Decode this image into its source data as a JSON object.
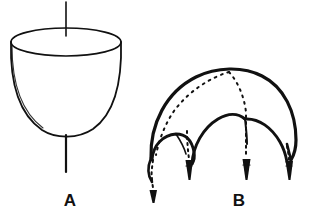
{
  "figure": {
    "title": "",
    "background_color": "#ffffff",
    "ink_color": "#111111",
    "width": 309,
    "height": 219,
    "panels": [
      {
        "id": "A",
        "label": "A",
        "label_x": 70,
        "label_y": 200,
        "description": "contracted bell in side view with vertical axis line above and stalk below"
      },
      {
        "id": "B",
        "label": "B",
        "label_x": 239,
        "label_y": 200,
        "description": "expanded bell in side view with four tentacles drawn as dashed arrows"
      }
    ]
  },
  "panel_a": {
    "label": "A",
    "axis_line": {
      "x": 66,
      "y_top": 2,
      "y_bottom": 36
    },
    "rim_ellipse": {
      "cx": 66,
      "cy": 42,
      "rx": 55,
      "ry": 14
    },
    "bell_left_x": 11,
    "bell_right_x": 121,
    "bell_bottom_y": 137,
    "stalk": {
      "x": 66,
      "y_top": 136,
      "y_bottom": 172
    }
  },
  "panel_b": {
    "label": "B",
    "apex": {
      "x": 229,
      "y": 72
    },
    "outer_arch": "broad umbrella margin curve from lower-left to lower-right",
    "inner_arch_count": 2,
    "tentacle_count": 4,
    "tentacles": [
      {
        "id": "tentacle-1",
        "tip_x": 155,
        "tip_y": 186
      },
      {
        "id": "tentacle-2",
        "tip_x": 190,
        "tip_y": 164
      },
      {
        "id": "tentacle-3",
        "tip_x": 248,
        "tip_y": 164
      },
      {
        "id": "tentacle-4",
        "tip_x": 290,
        "tip_y": 163
      }
    ],
    "dash_pattern": "2 4"
  }
}
